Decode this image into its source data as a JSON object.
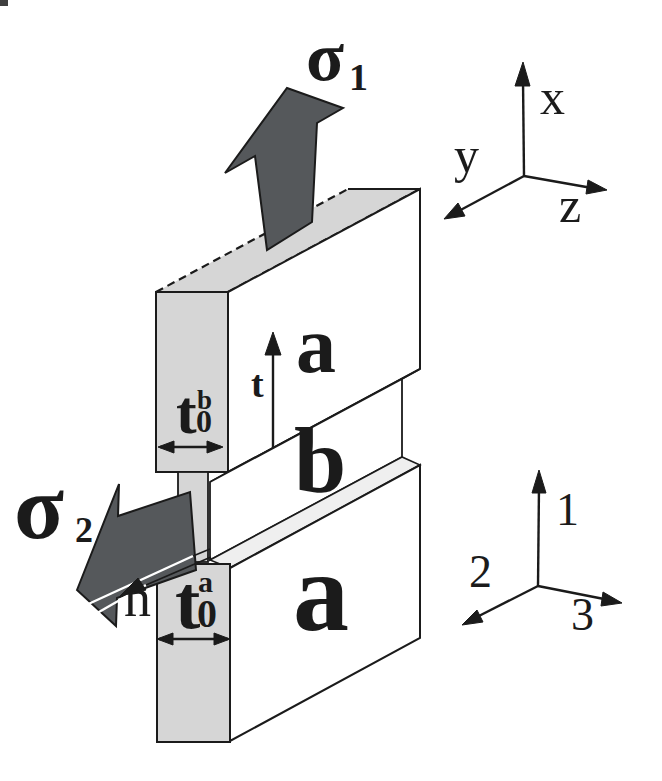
{
  "colors": {
    "background": "#ffffff",
    "face_gray": "#d6d6d6",
    "face_light": "#efefef",
    "face_white": "#ffffff",
    "arrow_dark": "#55585b",
    "ink": "#1b1b1b",
    "crack_highlight": "#ffffff"
  },
  "stress": {
    "sigma1": {
      "symbol": "σ",
      "sub": "1"
    },
    "sigma2": {
      "symbol": "σ",
      "sub": "2"
    }
  },
  "layers": {
    "top": "a",
    "middle": "b",
    "bottom": "a"
  },
  "directions": {
    "tangent": "t",
    "normal": "n"
  },
  "thickness": {
    "mid": {
      "base": "t",
      "sup": "b",
      "sub": "0"
    },
    "outer": {
      "base": "t",
      "sup": "a",
      "sub": "0"
    }
  },
  "axes_global": {
    "up": "x",
    "left": "y",
    "right": "z"
  },
  "axes_material": {
    "up": "1",
    "left": "2",
    "right": "3"
  }
}
